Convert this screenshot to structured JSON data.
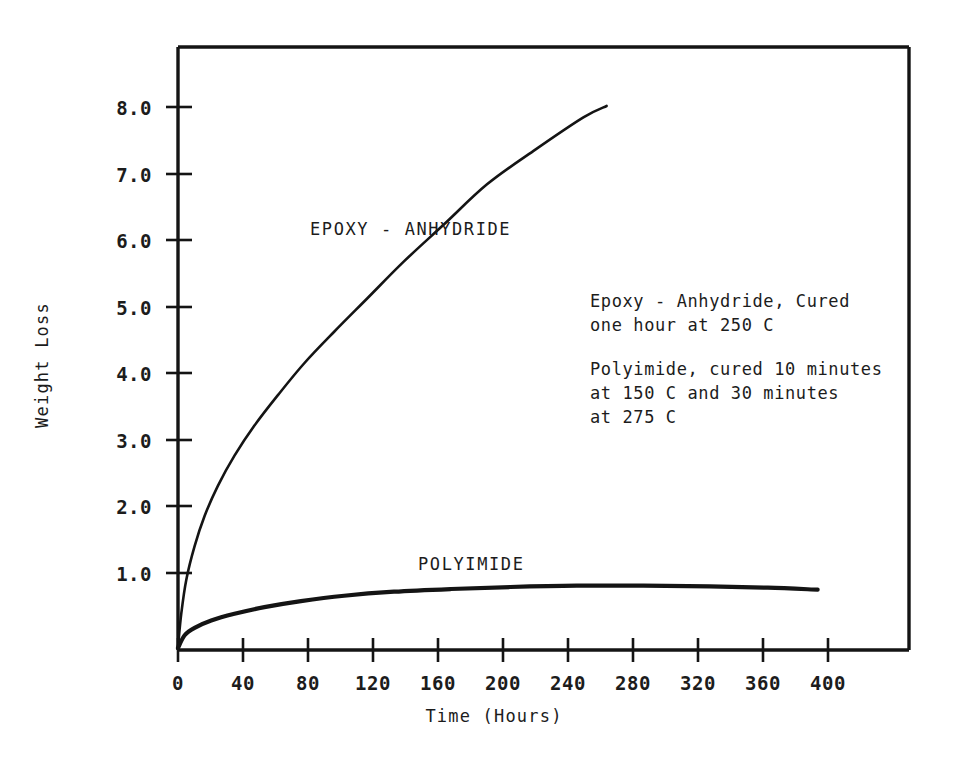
{
  "figure": {
    "background_color": "#ffffff",
    "ink_color": "#141414"
  },
  "chart_data": {
    "type": "line",
    "title": "",
    "xlabel": "Time (Hours)",
    "ylabel": "Weight Loss",
    "xlim": [
      0,
      440
    ],
    "ylim": [
      0,
      9.0
    ],
    "grid": false,
    "legend_position": "inline-curve-labels",
    "xticks": [
      0,
      40,
      80,
      120,
      160,
      200,
      240,
      280,
      320,
      360,
      400
    ],
    "xticklabels": [
      "0",
      "40",
      "80",
      "120",
      "160",
      "200",
      "240",
      "280",
      "320",
      "360",
      "400"
    ],
    "yticks": [
      1.0,
      2.0,
      3.0,
      4.0,
      5.0,
      6.0,
      7.0,
      8.0
    ],
    "yticklabels": [
      "1.0",
      "2.0",
      "3.0",
      "4.0",
      "5.0",
      "6.0",
      "7.0",
      "8.0"
    ],
    "series": [
      {
        "name": "EPOXY - ANHYDRIDE",
        "label": "EPOXY  -  ANHYDRIDE",
        "color": "#141414",
        "x": [
          0,
          2,
          5,
          10,
          16,
          24,
          34,
          46,
          60,
          76,
          94,
          114,
          136,
          160,
          186,
          214,
          244,
          258
        ],
        "y": [
          0.05,
          0.55,
          1.05,
          1.55,
          2.0,
          2.45,
          2.9,
          3.35,
          3.8,
          4.28,
          4.75,
          5.25,
          5.8,
          6.35,
          6.95,
          7.45,
          7.95,
          8.12
        ]
      },
      {
        "name": "POLYIMIDE",
        "label": "POLYIMIDE",
        "color": "#141414",
        "x": [
          0,
          4,
          10,
          20,
          34,
          52,
          74,
          100,
          130,
          164,
          200,
          240,
          280,
          320,
          355,
          385
        ],
        "y": [
          0.03,
          0.22,
          0.33,
          0.44,
          0.54,
          0.64,
          0.73,
          0.81,
          0.87,
          0.91,
          0.94,
          0.96,
          0.96,
          0.95,
          0.93,
          0.9
        ]
      }
    ],
    "annotations": [
      {
        "id": "epoxy-note-1",
        "text": "Epoxy - Anhydride, Cured"
      },
      {
        "id": "epoxy-note-2",
        "text": "one hour at 250 C"
      },
      {
        "id": "polyimide-note-1",
        "text": "Polyimide, cured 10 minutes"
      },
      {
        "id": "polyimide-note-2",
        "text": "at 150  C and 30 minutes"
      },
      {
        "id": "polyimide-note-3",
        "text": "at 275  C"
      }
    ]
  },
  "axes": {
    "y_title": "Weight Loss",
    "x_title": "Time (Hours)"
  },
  "curve_labels": {
    "epoxy": "EPOXY  -  ANHYDRIDE",
    "polyimide": "POLYIMIDE"
  },
  "notes": {
    "line1": "Epoxy - Anhydride, Cured",
    "line2": "one hour at 250 C",
    "line3": "Polyimide, cured 10 minutes",
    "line4": "at 150  C and 30 minutes",
    "line5": "at 275  C"
  },
  "y_labels": {
    "t1": "1.0",
    "t2": "2.0",
    "t3": "3.0",
    "t4": "4.0",
    "t5": "5.0",
    "t6": "6.0",
    "t7": "7.0",
    "t8": "8.0"
  },
  "x_labels": {
    "t0": "0",
    "t40": "40",
    "t80": "80",
    "t120": "120",
    "t160": "160",
    "t200": "200",
    "t240": "240",
    "t280": "280",
    "t320": "320",
    "t360": "360",
    "t400": "400"
  }
}
